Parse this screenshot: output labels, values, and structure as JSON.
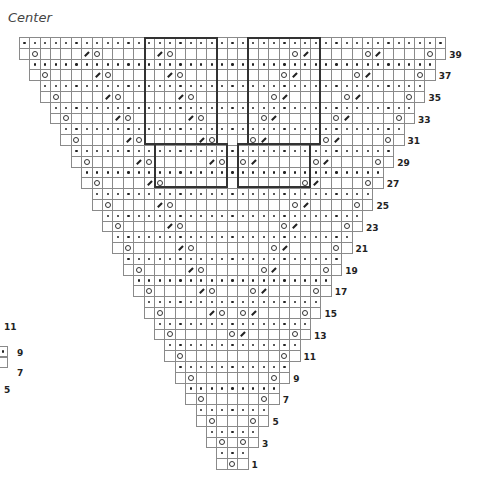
{
  "chart_title": "Center",
  "grid": {
    "columns": 43,
    "rows": 40,
    "origin_x": 8.4,
    "origin_y": 37,
    "cell_w": 10.4,
    "cell_h": 10.8,
    "center_col": 21
  },
  "legend_symbols": {
    "dot": "purl (dot)",
    "yo": "yarn over (circle)",
    "k2tog": "decrease (slash)",
    "blank": "knit (empty)"
  },
  "row_labels": [
    "39",
    "37",
    "35",
    "33",
    "31",
    "29",
    "27",
    "25",
    "23",
    "21",
    "19",
    "17",
    "15",
    "13",
    "11",
    "9",
    "7",
    "5",
    "3",
    "1"
  ],
  "left_fragment_labels": [
    "11",
    "9",
    "7",
    "5"
  ],
  "colors": {
    "grid": "#8a8a8a",
    "ink": "#222222",
    "box_border": "#333333"
  }
}
